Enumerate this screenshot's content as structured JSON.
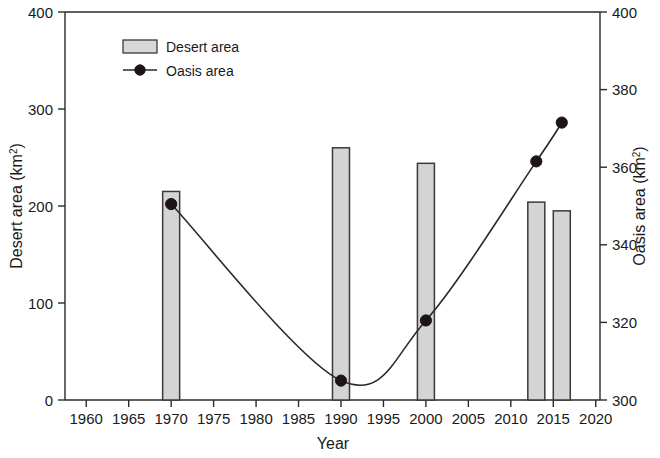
{
  "chart_data": {
    "type": "bar",
    "title": "",
    "subtitle": "",
    "xlabel": "Year",
    "ylabel": "Desert area (km2)",
    "ylabel_text": "Desert area (km",
    "ylabel_sup": "2",
    "ylabel_tail": ")",
    "y2label_text": "Oasis area (km",
    "y2label_sup": "2",
    "y2label_tail": ")",
    "xlim": [
      1957.5,
      2020.5
    ],
    "ylim": [
      0,
      400
    ],
    "y2lim": [
      300,
      400
    ],
    "grid": false,
    "legend_position": "top-left-inside",
    "xticks": [
      1960,
      1965,
      1970,
      1975,
      1980,
      1985,
      1990,
      1995,
      2000,
      2005,
      2010,
      2015,
      2020
    ],
    "xticklabels": [
      "1960",
      "1965",
      "1970",
      "1975",
      "1980",
      "1985",
      "1990",
      "1995",
      "2000",
      "2005",
      "2010",
      "2015",
      "2020"
    ],
    "yticks": [
      0,
      100,
      200,
      300,
      400
    ],
    "yticklabels": [
      "0",
      "100",
      "200",
      "300",
      "400"
    ],
    "y2ticks": [
      300,
      320,
      340,
      360,
      380,
      400
    ],
    "y2ticklabels": [
      "300",
      "320",
      "340",
      "360",
      "380",
      "400"
    ],
    "series": [
      {
        "name": "Desert area",
        "type": "bar",
        "axis": "left",
        "units": "km2",
        "color": "#d4d4d4",
        "edge_color": "#3a3a3a",
        "x": [
          1970,
          1990,
          2000,
          2013,
          2016
        ],
        "values": [
          215,
          260,
          244,
          204,
          195
        ]
      },
      {
        "name": "Oasis area",
        "type": "line",
        "axis": "right",
        "units": "km2",
        "color": "#2a2a2a",
        "marker": "filled-circle",
        "x": [
          1970,
          1990,
          2000,
          2013,
          2016
        ],
        "values": [
          350.5,
          305.0,
          320.5,
          361.5,
          371.5
        ]
      }
    ]
  },
  "legend": {
    "items": [
      {
        "label": "Desert area",
        "swatch": "bar-swatch-icon"
      },
      {
        "label": "Oasis area",
        "swatch": "line-marker-swatch-icon"
      }
    ]
  }
}
